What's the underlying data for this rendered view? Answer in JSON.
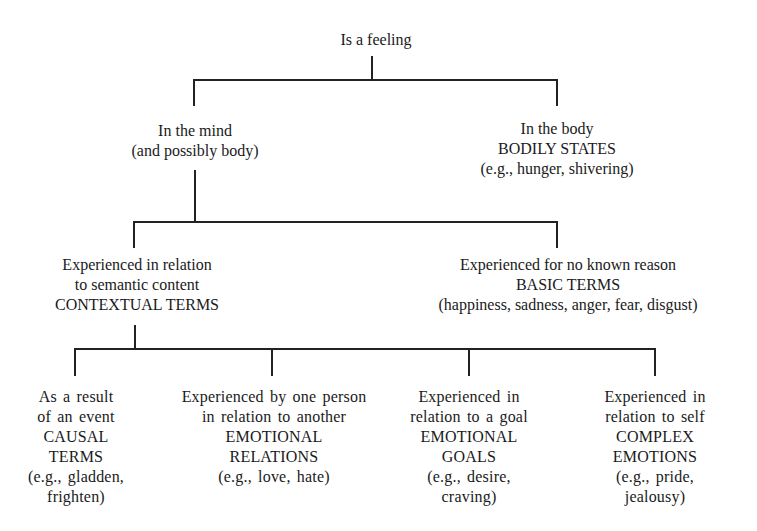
{
  "diagram": {
    "root": {
      "lines": [
        "Is a feeling"
      ]
    },
    "level1": {
      "mind": {
        "lines": [
          "In the mind",
          "(and possibly body)"
        ]
      },
      "body": {
        "lines": [
          "In the body",
          "BODILY STATES",
          "(e.g., hunger, shivering)"
        ]
      }
    },
    "level2": {
      "contextual": {
        "lines": [
          "Experienced in relation",
          "to semantic content",
          "CONTEXTUAL TERMS"
        ]
      },
      "basic": {
        "lines": [
          "Experienced for no known reason",
          "BASIC TERMS",
          "(happiness, sadness, anger, fear, disgust)"
        ]
      }
    },
    "level3": [
      {
        "lines": [
          "As a result",
          "of an event",
          "CAUSAL",
          "TERMS",
          "(e.g., gladden,",
          "frighten)"
        ]
      },
      {
        "lines": [
          "Experienced by one person",
          "in relation to another",
          "EMOTIONAL",
          "RELATIONS",
          "(e.g., love, hate)"
        ]
      },
      {
        "lines": [
          "Experienced in",
          "relation to a goal",
          "EMOTIONAL",
          "GOALS",
          "(e.g., desire,",
          "craving)"
        ]
      },
      {
        "lines": [
          "Experienced in",
          "relation to self",
          "COMPLEX",
          "EMOTIONS",
          "(e.g., pride,",
          "jealousy)"
        ]
      }
    ],
    "colors": {
      "background": "#ffffff",
      "line": "#222222",
      "text": "#1a1a1a"
    }
  }
}
